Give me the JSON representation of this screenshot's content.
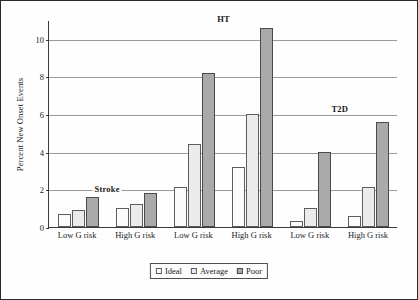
{
  "chart_data": {
    "type": "bar",
    "title": "",
    "xlabel": "",
    "ylabel": "Percent New Onset Events",
    "ylim": [
      0,
      11
    ],
    "yticks": [
      0,
      2,
      4,
      6,
      8,
      10
    ],
    "ytick_labels": [
      "0",
      "2",
      "4",
      "6",
      "8",
      "10"
    ],
    "grid": "horizontal",
    "legend_position": "bottom-center",
    "categories": [
      "Low G risk",
      "High G risk",
      "Low G risk",
      "High G risk",
      "Low G risk",
      "High G risk"
    ],
    "series": [
      {
        "name": "Ideal",
        "color": "#fbfbfb",
        "values": [
          0.7,
          1.0,
          2.1,
          3.2,
          0.3,
          0.6
        ]
      },
      {
        "name": "Average",
        "color": "#ebebeb",
        "values": [
          0.9,
          1.2,
          4.4,
          6.0,
          1.0,
          2.1
        ]
      },
      {
        "name": "Poor",
        "color": "#aaaaaa",
        "values": [
          1.6,
          1.8,
          8.2,
          10.6,
          4.0,
          5.6
        ]
      }
    ],
    "annotations": [
      {
        "text": "Stroke",
        "x_group_center": 0.5,
        "y": 2.05
      },
      {
        "text": "HT",
        "x_group_center": 2.5,
        "y": 11.1
      },
      {
        "text": "T2D",
        "x_group_center": 4.5,
        "y": 6.35
      }
    ]
  },
  "legend": {
    "items": [
      {
        "label": "Ideal"
      },
      {
        "label": "Average"
      },
      {
        "label": "Poor"
      }
    ]
  }
}
